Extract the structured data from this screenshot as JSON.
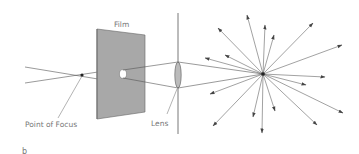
{
  "diagram": {
    "labels": {
      "film": "Film",
      "point_of_focus": "Point of Focus",
      "lens": "Lens",
      "panel_letter": "b"
    },
    "colors": {
      "line": "#555555",
      "film_fill": "#a8a8a8",
      "film_edge": "#666666",
      "lens_fill": "#bbbbbb",
      "text": "#777777"
    }
  }
}
